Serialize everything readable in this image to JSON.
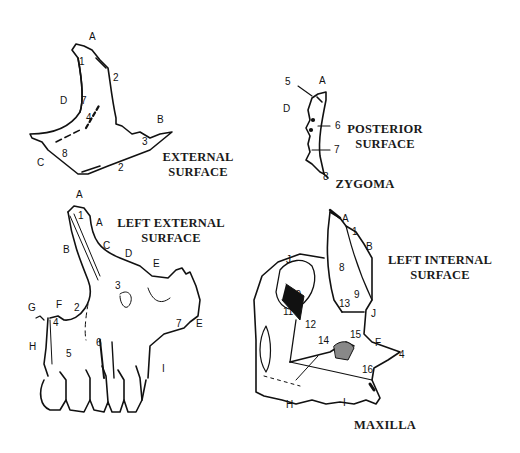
{
  "figure": {
    "bone": "MAXILLA",
    "panels": [
      {
        "id": "zygoma-external",
        "title_line1": "EXTERNAL",
        "title_line2": "SURFACE",
        "labels": [
          "A",
          "1",
          "2",
          "D",
          "7",
          "4",
          "B",
          "3",
          "C",
          "8",
          "2",
          "A"
        ]
      },
      {
        "id": "zygoma-posterior",
        "title_line1": "POSTERIOR",
        "title_line2": "SURFACE",
        "caption": "ZYGOMA",
        "labels": [
          "5",
          "A",
          "D",
          "6",
          "7",
          "8"
        ]
      },
      {
        "id": "maxilla-left-external",
        "title_line1": "LEFT EXTERNAL",
        "title_line2": "SURFACE",
        "labels": [
          "A",
          "1",
          "A",
          "B",
          "C",
          "D",
          "E",
          "3",
          "G",
          "F",
          "2",
          "4",
          "7",
          "E",
          "H",
          "5",
          "6",
          "I"
        ]
      },
      {
        "id": "maxilla-left-internal",
        "title_line1": "LEFT INTERNAL",
        "title_line2": "SURFACE",
        "caption": "MAXILLA",
        "labels": [
          "A",
          "1",
          "B",
          "J",
          "8",
          "10",
          "9",
          "13",
          "J",
          "11",
          "12",
          "14",
          "15",
          "F",
          "4",
          "16",
          "H",
          "I"
        ]
      }
    ]
  }
}
